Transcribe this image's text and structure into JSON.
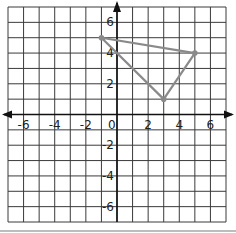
{
  "chart_data": {
    "type": "scatter",
    "title": "",
    "xlabel": "",
    "ylabel": "",
    "xlim": [
      -7,
      7
    ],
    "ylim": [
      -7,
      7
    ],
    "grid": true,
    "x_ticks": [
      -6,
      -4,
      -2,
      0,
      2,
      4,
      6
    ],
    "y_ticks": [
      6,
      4,
      2,
      -2,
      -4,
      -6
    ],
    "x_tick_labels": [
      "-6",
      "-4",
      "-2",
      "0",
      "2",
      "4",
      "6"
    ],
    "y_tick_labels": [
      "6",
      "4",
      "2",
      "-2",
      "-4",
      "-6"
    ],
    "polygon": {
      "name": "triangle",
      "vertices": [
        {
          "x": -1,
          "y": 5
        },
        {
          "x": 5,
          "y": 4
        },
        {
          "x": 3,
          "y": 1
        }
      ],
      "stroke_color": "#8a8a8a"
    },
    "colors": {
      "grid": "#3a3a3a",
      "axis": "#111111",
      "text": "#222222"
    }
  }
}
